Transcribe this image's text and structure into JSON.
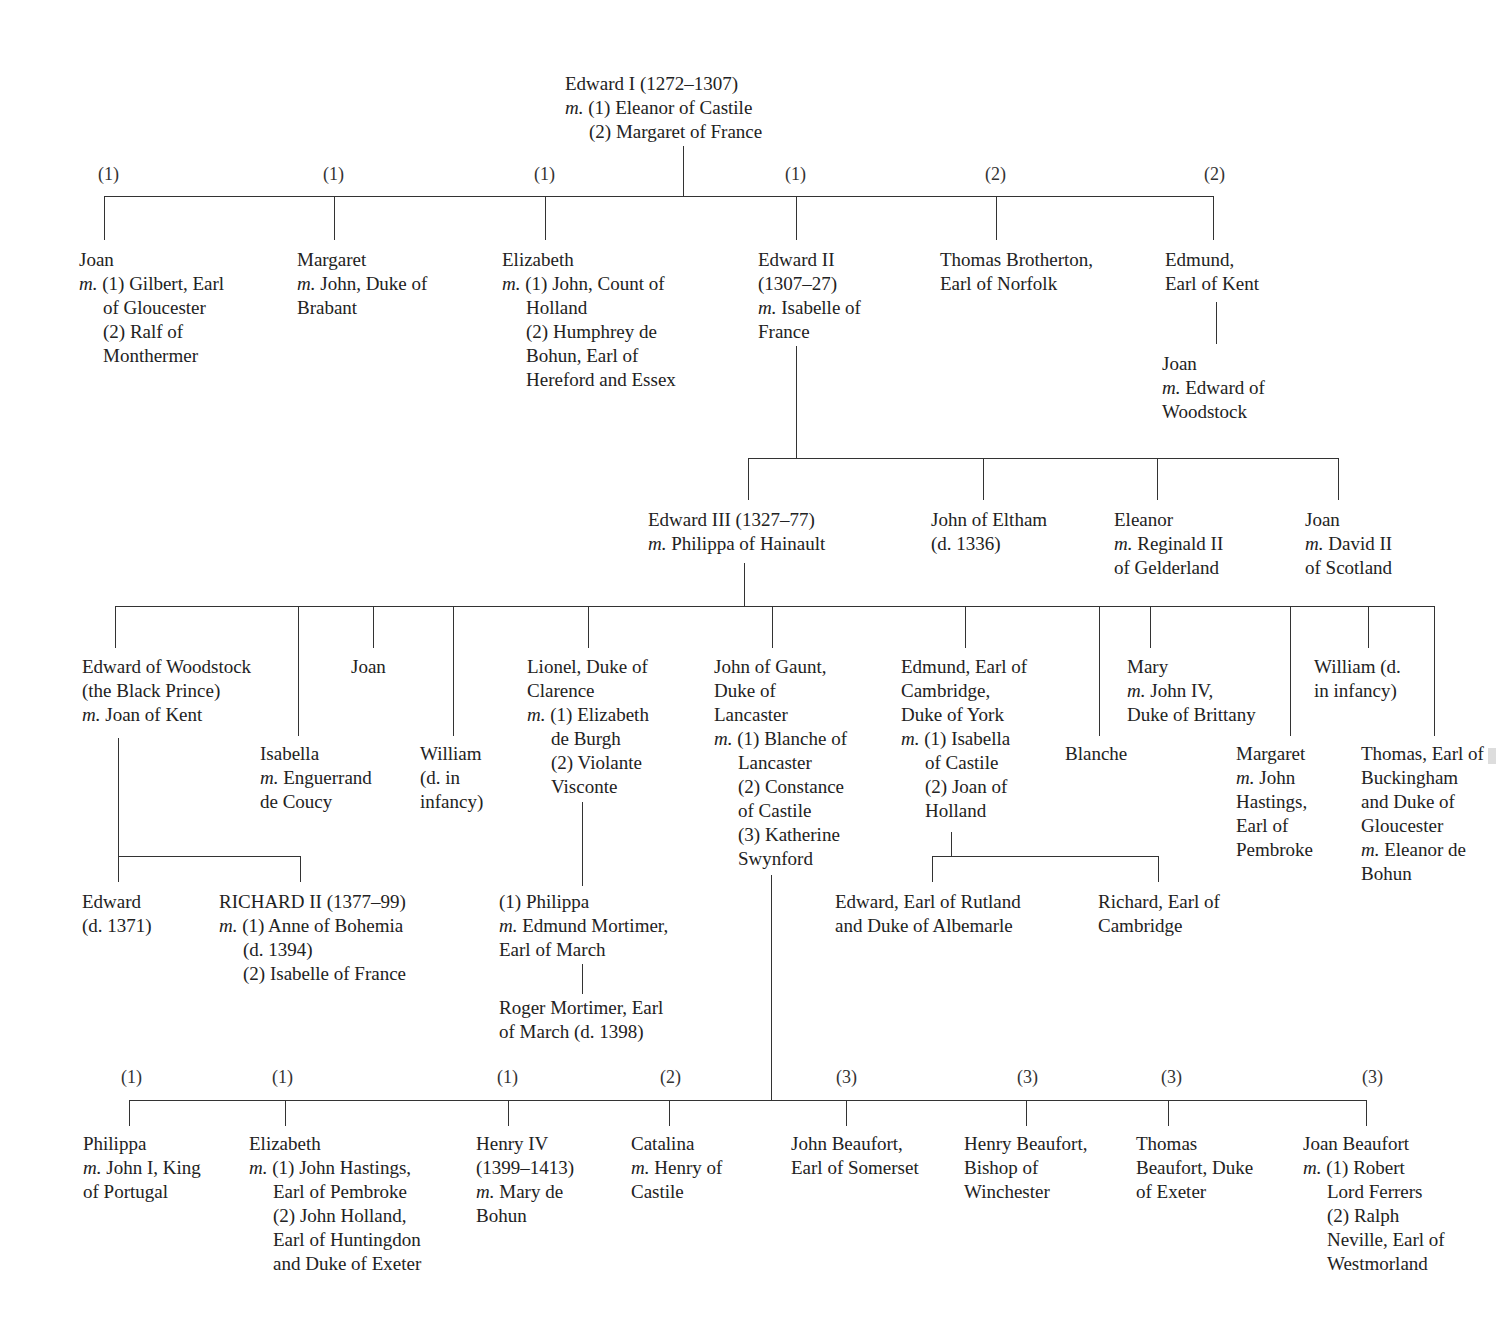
{
  "root": {
    "lines": [
      "Edward I (1272–1307)",
      "m. (1) Eleanor of Castile",
      "(2) Margaret of France"
    ]
  },
  "gen1": {
    "markers": [
      "(1)",
      "(1)",
      "(1)",
      "(1)",
      "(2)",
      "(2)"
    ],
    "children": [
      {
        "name": "Joan",
        "lines": [
          "m. (1) Gilbert, Earl",
          "of Gloucester",
          "(2) Ralf of",
          "Monthermer"
        ]
      },
      {
        "name": "Margaret",
        "lines": [
          "m. John, Duke of",
          "Brabant"
        ]
      },
      {
        "name": "Elizabeth",
        "lines": [
          "m. (1) John, Count of",
          "Holland",
          "(2) Humphrey de",
          "Bohun, Earl of",
          "Hereford and Essex"
        ]
      },
      {
        "name": "Edward II",
        "lines": [
          "(1307–27)",
          "m. Isabelle of",
          "France"
        ]
      },
      {
        "name": "Thomas Brotherton,",
        "lines": [
          "Earl of Norfolk"
        ]
      },
      {
        "name": "Edmund,",
        "lines": [
          "Earl of Kent"
        ]
      }
    ],
    "kent_child": {
      "name": "Joan",
      "lines": [
        "m. Edward of",
        "Woodstock"
      ]
    }
  },
  "gen2": {
    "children": [
      {
        "name": "Edward III (1327–77)",
        "lines": [
          "m. Philippa of Hainault"
        ]
      },
      {
        "name": "John of Eltham",
        "lines": [
          "(d. 1336)"
        ]
      },
      {
        "name": "Eleanor",
        "lines": [
          "m. Reginald II",
          "of Gelderland"
        ]
      },
      {
        "name": "Joan",
        "lines": [
          "m. David II",
          "of Scotland"
        ]
      }
    ]
  },
  "gen3": {
    "children": [
      {
        "name": "Edward of Woodstock",
        "lines": [
          "(the Black Prince)",
          "m. Joan of Kent"
        ]
      },
      {
        "name": "Isabella",
        "lines": [
          "m. Enguerrand",
          "de Coucy"
        ]
      },
      {
        "name": "Joan",
        "lines": []
      },
      {
        "name": "William",
        "lines": [
          "(d. in",
          "infancy)"
        ]
      },
      {
        "name": "Lionel, Duke of",
        "lines": [
          "Clarence",
          "m. (1) Elizabeth",
          "de Burgh",
          "(2) Violante",
          "Visconte"
        ]
      },
      {
        "name": "John of Gaunt,",
        "lines": [
          "Duke of",
          "Lancaster",
          "m. (1) Blanche of",
          "Lancaster",
          "(2) Constance",
          "of Castile",
          "(3) Katherine",
          "Swynford"
        ]
      },
      {
        "name": "Edmund, Earl of",
        "lines": [
          "Cambridge,",
          "Duke of York",
          "m. (1) Isabella",
          "of Castile",
          "(2) Joan of",
          "Holland"
        ]
      },
      {
        "name": "Blanche",
        "lines": []
      },
      {
        "name": "Mary",
        "lines": [
          "m. John IV,",
          "Duke of Brittany"
        ]
      },
      {
        "name": "Margaret",
        "lines": [
          "m. John",
          "Hastings,",
          "Earl of",
          "Pembroke"
        ]
      },
      {
        "name": "William (d.",
        "lines": [
          "in infancy)"
        ]
      },
      {
        "name": "Thomas, Earl of",
        "lines": [
          "Buckingham",
          "and Duke of",
          "Gloucester",
          "m. Eleanor de",
          "Bohun"
        ]
      }
    ]
  },
  "black_prince_children": [
    {
      "name": "Edward",
      "lines": [
        "(d. 1371)"
      ]
    },
    {
      "name": "RICHARD II (1377–99)",
      "lines": [
        "m. (1) Anne of Bohemia",
        "(d. 1394)",
        "(2) Isabelle of France"
      ]
    }
  ],
  "lionel_line": [
    {
      "name": "(1) Philippa",
      "lines": [
        "m. Edmund Mortimer,",
        "Earl of March"
      ]
    },
    {
      "name": "Roger Mortimer, Earl",
      "lines": [
        "of March (d. 1398)"
      ]
    }
  ],
  "york_children": [
    {
      "name": "Edward, Earl of Rutland",
      "lines": [
        "and Duke of Albemarle"
      ]
    },
    {
      "name": "Richard, Earl of",
      "lines": [
        "Cambridge"
      ]
    }
  ],
  "gaunt_children": {
    "markers": [
      "(1)",
      "(1)",
      "(1)",
      "(2)",
      "(3)",
      "(3)",
      "(3)",
      "(3)"
    ],
    "children": [
      {
        "name": "Philippa",
        "lines": [
          "m. John I, King",
          "of Portugal"
        ]
      },
      {
        "name": "Elizabeth",
        "lines": [
          "m. (1) John Hastings,",
          "Earl of Pembroke",
          "(2) John Holland,",
          "Earl of Huntingdon",
          "and Duke of Exeter"
        ]
      },
      {
        "name": "Henry IV",
        "lines": [
          "(1399–1413)",
          "m. Mary de",
          "Bohun"
        ]
      },
      {
        "name": "Catalina",
        "lines": [
          "m. Henry of",
          "Castile"
        ]
      },
      {
        "name": "John Beaufort,",
        "lines": [
          "Earl of Somerset"
        ]
      },
      {
        "name": "Henry Beaufort,",
        "lines": [
          "Bishop of",
          "Winchester"
        ]
      },
      {
        "name": "Thomas",
        "lines": [
          "Beaufort, Duke",
          "of Exeter"
        ]
      },
      {
        "name": "Joan Beaufort",
        "lines": [
          "m. (1) Robert",
          "Lord Ferrers",
          "(2) Ralph",
          "Neville, Earl of",
          "Westmorland"
        ]
      }
    ]
  }
}
